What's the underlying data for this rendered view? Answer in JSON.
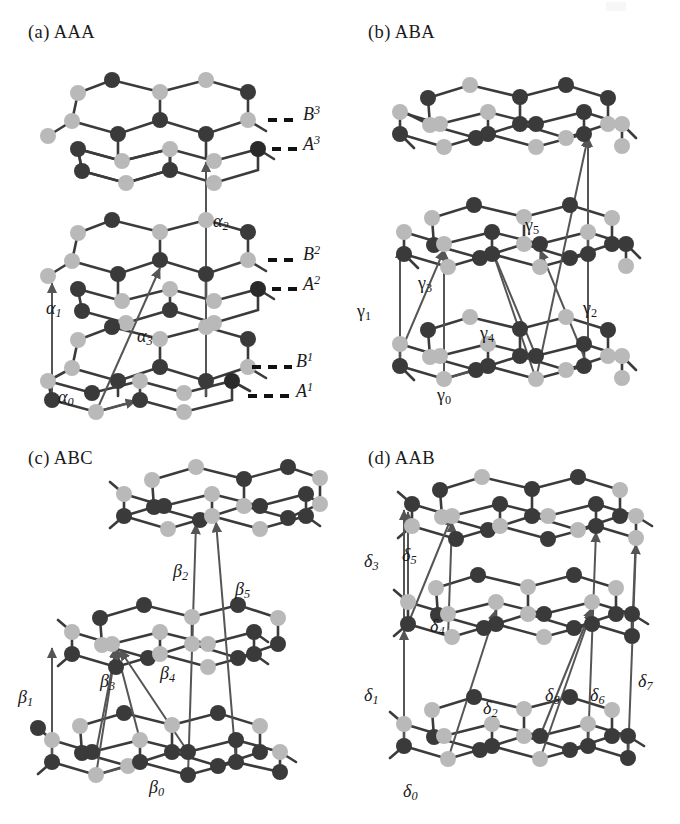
{
  "figure": {
    "domain": "diagram",
    "atom_colors": {
      "sublattice_A_dark": "#3a3a3a",
      "sublattice_B_light": "#b9b9b9",
      "bond": "#3b3b3b",
      "arrow": "#555555"
    },
    "panels": [
      {
        "id": "a",
        "title": "(a) AAA",
        "stacking": "AAA",
        "layer_count": 3,
        "hopping_labels": [
          {
            "symbol": "α",
            "sub": "0",
            "style": "italic",
            "x": 58,
            "y": 388
          },
          {
            "symbol": "α",
            "sub": "1",
            "style": "italic",
            "x": 46,
            "y": 305
          },
          {
            "symbol": "α",
            "sub": "2",
            "style": "italic",
            "x": 213,
            "y": 218
          },
          {
            "symbol": "α",
            "sub": "3",
            "style": "italic",
            "x": 137,
            "y": 333
          }
        ],
        "sublattice_labels": [
          {
            "letter": "B",
            "sup": "3",
            "x": 295,
            "y": 105
          },
          {
            "letter": "A",
            "sup": "3",
            "x": 295,
            "y": 135
          },
          {
            "letter": "B",
            "sup": "2",
            "x": 295,
            "y": 245
          },
          {
            "letter": "A",
            "sup": "2",
            "x": 295,
            "y": 275
          },
          {
            "letter": "B",
            "sup": "1",
            "x": 295,
            "y": 352
          },
          {
            "letter": "A",
            "sup": "1",
            "x": 295,
            "y": 382
          }
        ]
      },
      {
        "id": "b",
        "title": "(b) ABA",
        "stacking": "ABA",
        "layer_count": 3,
        "hopping_labels": [
          {
            "symbol": "γ",
            "sub": "0",
            "style": "upright",
            "x": 97,
            "y": 392
          },
          {
            "symbol": "γ",
            "sub": "1",
            "style": "upright",
            "x": 17,
            "y": 308
          },
          {
            "symbol": "γ",
            "sub": "2",
            "style": "upright",
            "x": 243,
            "y": 305
          },
          {
            "symbol": "γ",
            "sub": "3",
            "style": "upright",
            "x": 78,
            "y": 280
          },
          {
            "symbol": "γ",
            "sub": "4",
            "style": "upright",
            "x": 140,
            "y": 330
          },
          {
            "symbol": "γ",
            "sub": "5",
            "style": "upright",
            "x": 185,
            "y": 222
          }
        ],
        "sublattice_labels": []
      },
      {
        "id": "c",
        "title": "(c) ABC",
        "stacking": "ABC",
        "layer_count": 3,
        "hopping_labels": [
          {
            "symbol": "β",
            "sub": "0",
            "style": "italic",
            "x": 149,
            "y": 364
          },
          {
            "symbol": "β",
            "sub": "1",
            "style": "italic",
            "x": 18,
            "y": 274
          },
          {
            "symbol": "β",
            "sub": "2",
            "style": "italic",
            "x": 173,
            "y": 148
          },
          {
            "symbol": "β",
            "sub": "3",
            "style": "italic",
            "x": 100,
            "y": 258
          },
          {
            "symbol": "β",
            "sub": "4",
            "style": "italic",
            "x": 160,
            "y": 250
          },
          {
            "symbol": "β",
            "sub": "5",
            "style": "italic",
            "x": 235,
            "y": 166
          }
        ],
        "sublattice_labels": []
      },
      {
        "id": "d",
        "title": "(d) AAB",
        "stacking": "AAB",
        "layer_count": 3,
        "hopping_labels": [
          {
            "symbol": "δ",
            "sub": "0",
            "style": "italic",
            "x": 63,
            "y": 368
          },
          {
            "symbol": "δ",
            "sub": "1",
            "style": "italic",
            "x": 24,
            "y": 272
          },
          {
            "symbol": "δ",
            "sub": "2",
            "style": "italic",
            "x": 143,
            "y": 285
          },
          {
            "symbol": "δ",
            "sub": "3",
            "style": "italic",
            "x": 24,
            "y": 138
          },
          {
            "symbol": "δ",
            "sub": "4",
            "style": "italic",
            "x": 90,
            "y": 203
          },
          {
            "symbol": "δ",
            "sub": "5",
            "style": "italic",
            "x": 62,
            "y": 132
          },
          {
            "symbol": "δ",
            "sub": "6",
            "style": "italic",
            "x": 250,
            "y": 272
          },
          {
            "symbol": "δ",
            "sub": "7",
            "style": "italic",
            "x": 298,
            "y": 258
          },
          {
            "symbol": "δ",
            "sub": "8",
            "style": "italic",
            "x": 205,
            "y": 272
          }
        ],
        "sublattice_labels": []
      }
    ]
  }
}
